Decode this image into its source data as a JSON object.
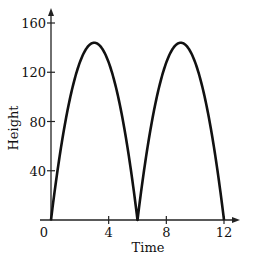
{
  "chart_data": {
    "type": "line",
    "title": "",
    "xlabel": "Time",
    "ylabel": "Height",
    "xlim": [
      0,
      12
    ],
    "ylim": [
      0,
      160
    ],
    "x_ticks": [
      0,
      4,
      8,
      12
    ],
    "y_ticks": [
      40,
      80,
      120,
      160
    ],
    "x_tick_labels": [
      "0",
      "4",
      "8",
      "12"
    ],
    "y_tick_labels": [
      "40",
      "80",
      "120",
      "160"
    ],
    "grid": false,
    "legend": null,
    "series": [
      {
        "name": "height",
        "description": "Repeating parabolic arcs, h = 16t(6 - t) for 0<=t<=6, repeated for 6<=t<=12",
        "x": [
          0,
          0.5,
          1,
          1.5,
          2,
          2.5,
          3,
          3.5,
          4,
          4.5,
          5,
          5.5,
          6,
          6.5,
          7,
          7.5,
          8,
          8.5,
          9,
          9.5,
          10,
          10.5,
          11,
          11.5,
          12
        ],
        "values": [
          0,
          44,
          80,
          108,
          128,
          140,
          144,
          140,
          128,
          108,
          80,
          44,
          0,
          44,
          80,
          108,
          128,
          140,
          144,
          140,
          128,
          108,
          80,
          44,
          0
        ]
      }
    ],
    "color": "#111111"
  }
}
